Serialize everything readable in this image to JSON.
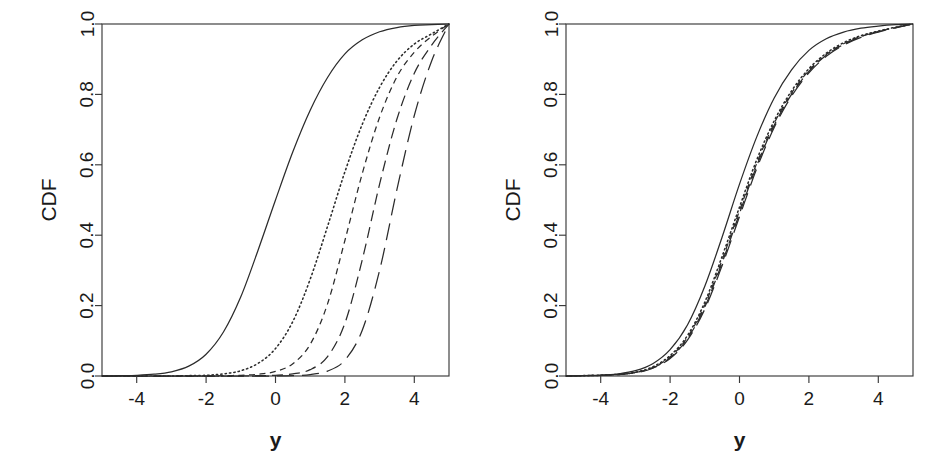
{
  "figure": {
    "background_color": "#ffffff",
    "line_color": "#2b2b2b",
    "axis_color": "#3a3a3a",
    "panel_count": 2
  },
  "chart_data": [
    {
      "type": "line",
      "panel": "left",
      "title": "",
      "xlabel": "y",
      "ylabel": "CDF",
      "xlim": [
        -5,
        5
      ],
      "ylim": [
        0,
        1
      ],
      "xticks": [
        -4,
        -2,
        0,
        2,
        4
      ],
      "xticklabels": [
        "-4",
        "-2",
        "0",
        "2",
        "4"
      ],
      "yticks": [
        0.0,
        0.2,
        0.4,
        0.6,
        0.8,
        1.0
      ],
      "yticklabels": [
        "0.0",
        "0.2",
        "0.4",
        "0.6",
        "0.8",
        "1.0"
      ],
      "grid": false,
      "legend": "none",
      "x": [
        -5.0,
        -4.5,
        -4.0,
        -3.5,
        -3.0,
        -2.5,
        -2.0,
        -1.5,
        -1.0,
        -0.5,
        0.0,
        0.5,
        1.0,
        1.5,
        2.0,
        2.5,
        3.0,
        3.5,
        4.0,
        4.5,
        5.0
      ],
      "series": [
        {
          "name": "curve-1",
          "linestyle": "solid",
          "median": 0.0,
          "values": [
            0.0,
            0.001,
            0.002,
            0.005,
            0.012,
            0.028,
            0.062,
            0.125,
            0.225,
            0.358,
            0.5,
            0.637,
            0.755,
            0.848,
            0.915,
            0.955,
            0.978,
            0.99,
            0.996,
            0.998,
            1.0
          ]
        },
        {
          "name": "curve-2",
          "linestyle": "dotted",
          "median": 1.27,
          "values": [
            0.0,
            0.0,
            0.0,
            0.0,
            0.0,
            0.001,
            0.002,
            0.006,
            0.015,
            0.036,
            0.078,
            0.155,
            0.275,
            0.425,
            0.58,
            0.715,
            0.82,
            0.895,
            0.943,
            0.972,
            1.0
          ]
        },
        {
          "name": "curve-3",
          "linestyle": "dashed-short",
          "median": 2.1,
          "values": [
            0.0,
            0.0,
            0.0,
            0.0,
            0.0,
            0.0,
            0.0,
            0.001,
            0.002,
            0.005,
            0.013,
            0.035,
            0.09,
            0.205,
            0.385,
            0.575,
            0.735,
            0.85,
            0.92,
            0.965,
            1.0
          ]
        },
        {
          "name": "curve-4",
          "linestyle": "dashed-medium",
          "median": 2.95,
          "values": [
            0.0,
            0.0,
            0.0,
            0.0,
            0.0,
            0.0,
            0.0,
            0.0,
            0.0,
            0.001,
            0.002,
            0.006,
            0.018,
            0.055,
            0.15,
            0.33,
            0.545,
            0.73,
            0.86,
            0.94,
            1.0
          ]
        },
        {
          "name": "curve-5",
          "linestyle": "dashed-long",
          "median": 3.7,
          "values": [
            0.0,
            0.0,
            0.0,
            0.0,
            0.0,
            0.0,
            0.0,
            0.0,
            0.0,
            0.0,
            0.0,
            0.001,
            0.004,
            0.014,
            0.045,
            0.13,
            0.3,
            0.53,
            0.74,
            0.895,
            1.0
          ]
        }
      ]
    },
    {
      "type": "line",
      "panel": "right",
      "title": "",
      "xlabel": "y",
      "ylabel": "CDF",
      "xlim": [
        -5,
        5
      ],
      "ylim": [
        0,
        1
      ],
      "xticks": [
        -4,
        -2,
        0,
        2,
        4
      ],
      "xticklabels": [
        "-4",
        "-2",
        "0",
        "2",
        "4"
      ],
      "yticks": [
        0.0,
        0.2,
        0.4,
        0.6,
        0.8,
        1.0
      ],
      "yticklabels": [
        "0.0",
        "0.2",
        "0.4",
        "0.6",
        "0.8",
        "1.0"
      ],
      "grid": false,
      "legend": "none",
      "x": [
        -5.0,
        -4.5,
        -4.0,
        -3.5,
        -3.0,
        -2.5,
        -2.0,
        -1.5,
        -1.0,
        -0.5,
        0.0,
        0.5,
        1.0,
        1.5,
        2.0,
        2.5,
        3.0,
        3.5,
        4.0,
        4.5,
        5.0
      ],
      "series": [
        {
          "name": "curve-1",
          "linestyle": "solid",
          "median": 0.05,
          "values": [
            0.0,
            0.001,
            0.002,
            0.006,
            0.015,
            0.035,
            0.075,
            0.145,
            0.255,
            0.395,
            0.545,
            0.68,
            0.79,
            0.87,
            0.925,
            0.958,
            0.977,
            0.988,
            0.994,
            0.998,
            1.0
          ]
        },
        {
          "name": "curve-2",
          "linestyle": "dotted",
          "median": 0.3,
          "values": [
            0.0,
            0.001,
            0.002,
            0.005,
            0.011,
            0.026,
            0.058,
            0.115,
            0.21,
            0.34,
            0.48,
            0.615,
            0.725,
            0.81,
            0.873,
            0.917,
            0.947,
            0.967,
            0.98,
            0.991,
            1.0
          ]
        },
        {
          "name": "curve-3",
          "linestyle": "dashed-short",
          "median": 0.33,
          "values": [
            0.0,
            0.001,
            0.002,
            0.004,
            0.01,
            0.024,
            0.054,
            0.11,
            0.202,
            0.33,
            0.47,
            0.605,
            0.718,
            0.804,
            0.868,
            0.913,
            0.944,
            0.965,
            0.979,
            0.99,
            1.0
          ]
        },
        {
          "name": "curve-4",
          "linestyle": "dashed-medium",
          "median": 0.36,
          "values": [
            0.0,
            0.001,
            0.002,
            0.004,
            0.01,
            0.023,
            0.052,
            0.106,
            0.196,
            0.322,
            0.462,
            0.598,
            0.712,
            0.8,
            0.865,
            0.911,
            0.942,
            0.964,
            0.978,
            0.99,
            1.0
          ]
        },
        {
          "name": "curve-5",
          "linestyle": "dashed-long",
          "median": 0.4,
          "values": [
            0.0,
            0.001,
            0.002,
            0.004,
            0.009,
            0.022,
            0.05,
            0.102,
            0.19,
            0.314,
            0.453,
            0.59,
            0.706,
            0.795,
            0.861,
            0.908,
            0.94,
            0.962,
            0.977,
            0.989,
            1.0
          ]
        }
      ]
    }
  ]
}
